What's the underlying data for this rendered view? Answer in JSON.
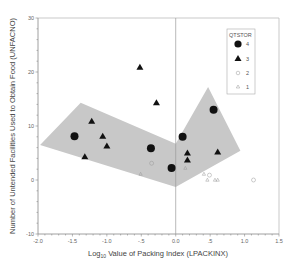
{
  "chart_data": {
    "type": "scatter",
    "title": "",
    "xlabel": "Log10 Value of Packing Index (LPACKINX)",
    "xlabel_parts": {
      "prefix": "Log",
      "sub": "10",
      "rest": " Value of Packing Index (LPACKINX)"
    },
    "ylabel": "Number of Untended Facilities Used to Obtain Food (UNFACNO)",
    "xlim": [
      -2.0,
      1.5
    ],
    "ylim": [
      -10,
      30
    ],
    "x_ticks": [
      -2.0,
      -1.5,
      -1.0,
      -0.5,
      0.0,
      0.5,
      1.0,
      1.5
    ],
    "x_tick_labels": [
      "-2.0",
      "-1.5",
      "-1.0",
      "-.5",
      "0.0",
      ".5",
      "1.0",
      "1.5"
    ],
    "y_ticks": [
      -10,
      0,
      10,
      20,
      30
    ],
    "y_tick_labels": [
      "-10",
      "0",
      "10",
      "20",
      "30"
    ],
    "grid": false,
    "reference_line_x": 0.0,
    "legend": {
      "title": "QTSTOR",
      "position": "upper right",
      "entries": [
        {
          "label": "4",
          "marker": "filled-circle"
        },
        {
          "label": "3",
          "marker": "filled-triangle"
        },
        {
          "label": "2",
          "marker": "open-circle"
        },
        {
          "label": "1",
          "marker": "small-triangle"
        }
      ]
    },
    "series": [
      {
        "name": "4",
        "marker": "filled-circle",
        "points": [
          [
            -1.47,
            8.1
          ],
          [
            -0.36,
            5.9
          ],
          [
            -0.06,
            2.2
          ],
          [
            0.1,
            8.0
          ],
          [
            0.55,
            13.0
          ]
        ]
      },
      {
        "name": "3",
        "marker": "filled-triangle",
        "points": [
          [
            -0.52,
            20.9
          ],
          [
            -0.28,
            14.3
          ],
          [
            -1.22,
            10.9
          ],
          [
            -1.06,
            8.1
          ],
          [
            -1.0,
            6.3
          ],
          [
            -1.32,
            4.3
          ],
          [
            0.17,
            5.0
          ],
          [
            0.17,
            3.7
          ],
          [
            0.61,
            5.2
          ]
        ]
      },
      {
        "name": "2",
        "marker": "open-circle",
        "points": [
          [
            -0.35,
            3.1
          ],
          [
            0.49,
            0.9
          ],
          [
            1.13,
            0.0
          ]
        ]
      },
      {
        "name": "1",
        "marker": "small-triangle",
        "points": [
          [
            -0.51,
            1.1
          ],
          [
            0.14,
            2.2
          ],
          [
            0.41,
            1.1
          ],
          [
            0.46,
            0.0
          ],
          [
            0.57,
            0.0
          ],
          [
            0.61,
            0.0
          ]
        ]
      }
    ],
    "shaded_region": {
      "color": "#c8c8c8",
      "polygon": [
        [
          -1.97,
          6.5
        ],
        [
          -1.38,
          14.3
        ],
        [
          0.0,
          6.7
        ],
        [
          0.47,
          17.2
        ],
        [
          0.94,
          5.4
        ],
        [
          0.0,
          -1.3
        ]
      ]
    }
  },
  "legend_box": {
    "title": "QTSTOR",
    "labels": [
      "4",
      "3",
      "2",
      "1"
    ]
  }
}
